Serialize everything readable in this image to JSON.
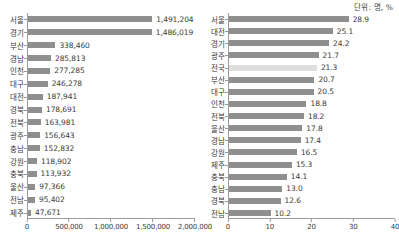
{
  "unit_note": "단위: 명, %",
  "chart_data": [
    {
      "type": "bar",
      "orientation": "horizontal",
      "title": "",
      "xlabel": "",
      "ylabel": "",
      "unit": "명",
      "xlim": [
        0,
        2000000
      ],
      "xticks": [
        0,
        500000,
        1000000,
        1500000,
        2000000
      ],
      "xticklabels": [
        "0",
        "500,000",
        "1,000,000",
        "1,500,000",
        "2,000,000"
      ],
      "grid": false,
      "legend": "none",
      "bar_color": "#8f8f8f",
      "categories": [
        "서울",
        "경기",
        "부산",
        "경남",
        "인천",
        "대구",
        "대전",
        "경북",
        "전북",
        "광주",
        "충남",
        "강원",
        "충북",
        "울산",
        "전남",
        "제주"
      ],
      "values": [
        1491204,
        1486019,
        338460,
        285813,
        277285,
        246278,
        187941,
        178691,
        163981,
        156643,
        152832,
        118902,
        113932,
        97366,
        95402,
        47671
      ],
      "value_labels": [
        "1,491,204",
        "1,486,019",
        "338,460",
        "285,813",
        "277,285",
        "246,278",
        "187,941",
        "178,691",
        "163,981",
        "156,643",
        "152,832",
        "118,902",
        "113,932",
        "97,366",
        "95,402",
        "47,671"
      ]
    },
    {
      "type": "bar",
      "orientation": "horizontal",
      "title": "",
      "xlabel": "",
      "ylabel": "",
      "unit": "%",
      "xlim": [
        0,
        40
      ],
      "xticks": [
        0,
        10,
        20,
        30,
        40
      ],
      "xticklabels": [
        "0",
        "10",
        "20",
        "30",
        "40"
      ],
      "grid": false,
      "legend": "none",
      "bar_color": "#8f8f8f",
      "highlight_color": "#dedede",
      "highlight_category": "전국",
      "categories": [
        "서울",
        "대전",
        "경기",
        "광주",
        "전국",
        "부산",
        "대구",
        "인천",
        "전북",
        "울산",
        "경남",
        "강원",
        "제주",
        "충북",
        "충남",
        "경북",
        "전남"
      ],
      "values": [
        28.9,
        25.1,
        24.2,
        21.7,
        21.3,
        20.7,
        20.5,
        18.8,
        18.2,
        17.8,
        17.4,
        16.5,
        15.3,
        14.1,
        13.0,
        12.6,
        10.2
      ],
      "value_labels": [
        "28.9",
        "25.1",
        "24.2",
        "21.7",
        "21.3",
        "20.7",
        "20.5",
        "18.8",
        "18.2",
        "17.8",
        "17.4",
        "16.5",
        "15.3",
        "14.1",
        "13.0",
        "12.6",
        "10.2"
      ]
    }
  ]
}
